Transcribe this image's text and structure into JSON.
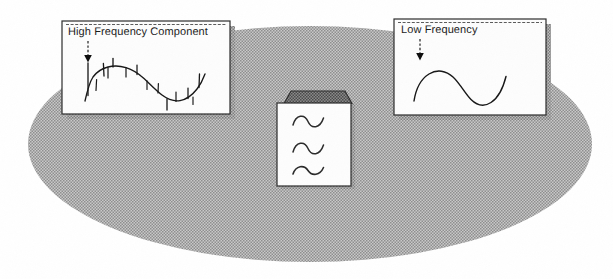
{
  "figure": {
    "background_color": "#ffffff",
    "ellipse_fill_color": "#a8a8a8",
    "panel_fill_color": "#fdfdfd",
    "panel_border_color": "#2b2b2b",
    "shadow_color": "#9a9a9a",
    "ink_color": "#1b1b1b",
    "box_top_color": "#6d6d6d"
  },
  "panels": {
    "high": {
      "caption": "High Frequency Component",
      "waveform_name": "spiky-sine-waveform",
      "arrow_style": "dashed-down-arrow"
    },
    "low": {
      "caption": "Low Frequency",
      "waveform_name": "smooth-sine-waveform",
      "arrow_style": "dashed-down-arrow"
    }
  },
  "filter_box": {
    "name": "filter-box",
    "glyphs": [
      "~",
      "~",
      "~"
    ],
    "glyph_name": "tilde-wave-glyph",
    "top_face": "dark-shaded-top"
  },
  "signal_line": {
    "name": "signal-line",
    "left_end_x": 130,
    "right_end_x": 512,
    "y": 140
  },
  "background_ellipse": {
    "name": "background-ellipse",
    "center_x": 310,
    "center_y": 144,
    "radius_x": 282,
    "radius_y": 118
  }
}
